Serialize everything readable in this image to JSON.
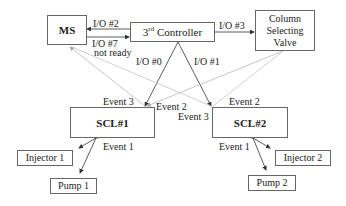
{
  "nodes": {
    "ms": {
      "label": "MS"
    },
    "controller": {
      "label_prefix": "3",
      "label_sup": "rd",
      "label_suffix": " Controller"
    },
    "valve": {
      "line1": "Column",
      "line2": "Selecting",
      "line3": "Valve"
    },
    "scl1": {
      "label": "SCL#1"
    },
    "scl2": {
      "label": "SCL#2"
    },
    "injector1": {
      "label": "Injector 1"
    },
    "pump1": {
      "label": "Pump 1"
    },
    "injector2": {
      "label": "Injector 2"
    },
    "pump2": {
      "label": "Pump 2"
    }
  },
  "edges": {
    "io2": "I/O #2",
    "io7": "I/O #7",
    "not_ready": "not ready",
    "io3": "I/O #3",
    "io0": "I/O #0",
    "io1": "I/O #1",
    "scl1_event3": "Event 3",
    "scl1_event2": "Event 2",
    "scl1_event1": "Event 1",
    "scl2_event2": "Event 2",
    "scl2_event3": "Event 3",
    "scl2_event1": "Event 1"
  },
  "colors": {
    "dark_line": "#333333",
    "gray_line": "#b8b8b8",
    "box_border": "#666666"
  }
}
